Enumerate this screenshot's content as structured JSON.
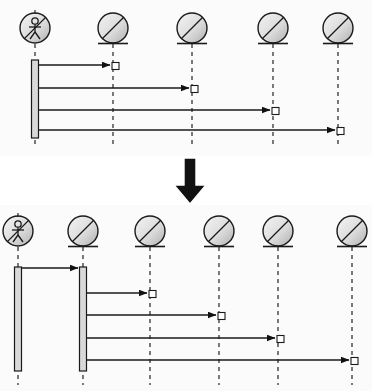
{
  "figure": {
    "kind": "uml-sequence-diagram-pair",
    "background_color": "#fbfbfb",
    "line_color": "#1a1a1a",
    "lifeline_color": "#333333",
    "activation_fill": "#d9d9d9",
    "object_fill_light": "#f2f2f2",
    "object_fill_dark": "#b8b8b8",
    "transition_arrow_color": "#111111"
  },
  "diagrams": [
    {
      "id": "before",
      "label": "before",
      "panel": {
        "x": 0,
        "y": 0,
        "width": 372,
        "height": 156
      },
      "participants": [
        {
          "id": "actor",
          "icon": "actor-stick-figure-icon",
          "type": "actor",
          "x": 35,
          "head_y": 28,
          "radius": 15,
          "lifeline_top": 44,
          "lifeline_bottom": 146
        },
        {
          "id": "object1",
          "icon": "object-circle-icon",
          "type": "object",
          "x": 113,
          "head_y": 28,
          "radius": 15,
          "lifeline_top": 44,
          "lifeline_bottom": 146
        },
        {
          "id": "object2",
          "icon": "object-circle-icon",
          "type": "object",
          "x": 192,
          "head_y": 28,
          "radius": 15,
          "lifeline_top": 44,
          "lifeline_bottom": 146
        },
        {
          "id": "object3",
          "icon": "object-circle-icon",
          "type": "object",
          "x": 273,
          "head_y": 28,
          "radius": 15,
          "lifeline_top": 44,
          "lifeline_bottom": 146
        },
        {
          "id": "object4",
          "icon": "object-circle-icon",
          "type": "object",
          "x": 338,
          "head_y": 28,
          "radius": 15,
          "lifeline_top": 44,
          "lifeline_bottom": 146
        }
      ],
      "activations": [
        {
          "id": "actor-activation",
          "participant": "actor",
          "x": 35,
          "y_top": 60,
          "y_bottom": 138,
          "width": 7
        }
      ],
      "messages": [
        {
          "index": 1,
          "from": "actor",
          "to": "object1",
          "x_start": 39,
          "x_end": 110,
          "y": 65,
          "arrowhead": "solid",
          "target_box": true
        },
        {
          "index": 2,
          "from": "actor",
          "to": "object2",
          "x_start": 39,
          "x_end": 189,
          "y": 88,
          "arrowhead": "solid",
          "target_box": true
        },
        {
          "index": 3,
          "from": "actor",
          "to": "object3",
          "x_start": 39,
          "x_end": 270,
          "y": 110,
          "arrowhead": "solid",
          "target_box": true
        },
        {
          "index": 4,
          "from": "actor",
          "to": "object4",
          "x_start": 39,
          "x_end": 335,
          "y": 130,
          "arrowhead": "solid",
          "target_box": true
        }
      ]
    },
    {
      "id": "after",
      "label": "after",
      "panel": {
        "x": 0,
        "y": 205,
        "width": 372,
        "height": 186
      },
      "participants": [
        {
          "id": "actor",
          "icon": "actor-stick-figure-icon",
          "type": "actor",
          "x": 18,
          "head_y": 231,
          "radius": 15,
          "lifeline_top": 247,
          "lifeline_bottom": 385
        },
        {
          "id": "intermediary",
          "icon": "object-circle-icon",
          "type": "object",
          "x": 83,
          "head_y": 231,
          "radius": 15,
          "lifeline_top": 247,
          "lifeline_bottom": 385
        },
        {
          "id": "object1",
          "icon": "object-circle-icon",
          "type": "object",
          "x": 150,
          "head_y": 231,
          "radius": 15,
          "lifeline_top": 247,
          "lifeline_bottom": 385
        },
        {
          "id": "object2",
          "icon": "object-circle-icon",
          "type": "object",
          "x": 219,
          "head_y": 231,
          "radius": 15,
          "lifeline_top": 247,
          "lifeline_bottom": 385
        },
        {
          "id": "object3",
          "icon": "object-circle-icon",
          "type": "object",
          "x": 278,
          "head_y": 231,
          "radius": 15,
          "lifeline_top": 247,
          "lifeline_bottom": 385
        },
        {
          "id": "object4",
          "icon": "object-circle-icon",
          "type": "object",
          "x": 352,
          "head_y": 231,
          "radius": 15,
          "lifeline_top": 247,
          "lifeline_bottom": 385
        }
      ],
      "activations": [
        {
          "id": "actor-activation",
          "participant": "actor",
          "x": 18,
          "y_top": 267,
          "y_bottom": 371,
          "width": 7
        },
        {
          "id": "intermediary-activation",
          "participant": "intermediary",
          "x": 83,
          "y_top": 267,
          "y_bottom": 371,
          "width": 7
        }
      ],
      "messages": [
        {
          "index": 1,
          "from": "actor",
          "to": "intermediary",
          "x_start": 22,
          "x_end": 80,
          "y": 268,
          "arrowhead": "solid",
          "target_box": false
        },
        {
          "index": 2,
          "from": "intermediary",
          "to": "object1",
          "x_start": 87,
          "x_end": 147,
          "y": 293,
          "arrowhead": "solid",
          "target_box": true
        },
        {
          "index": 3,
          "from": "intermediary",
          "to": "object2",
          "x_start": 87,
          "x_end": 216,
          "y": 315,
          "arrowhead": "solid",
          "target_box": true
        },
        {
          "index": 4,
          "from": "intermediary",
          "to": "object3",
          "x_start": 87,
          "x_end": 275,
          "y": 338,
          "arrowhead": "solid",
          "target_box": true
        },
        {
          "index": 5,
          "from": "intermediary",
          "to": "object4",
          "x_start": 87,
          "x_end": 349,
          "y": 360,
          "arrowhead": "solid",
          "target_box": true
        }
      ]
    }
  ],
  "transition": {
    "icon": "down-arrow-icon",
    "direction": "down",
    "x": 170,
    "y": 158,
    "width": 40,
    "height": 46
  }
}
